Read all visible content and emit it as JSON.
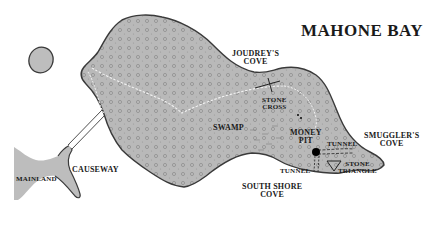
{
  "map": {
    "title": "MAHONE BAY",
    "colors": {
      "land": "#b9b9b9",
      "outline": "#3a3a3a",
      "water": "#ffffff",
      "text": "#1a1a1a",
      "money_pit": "#000000"
    },
    "labels": {
      "joudreys_cove_1": "JOUDREY'S",
      "joudreys_cove_2": "COVE",
      "stone_cross_1": "STONE",
      "stone_cross_2": "CROSS",
      "swamp": "SWAMP",
      "money_pit_1": "MONEY",
      "money_pit_2": "PIT",
      "tunnel_east": "TUNNEL",
      "tunnel_south": "TUNNEL",
      "smugglers_cove_1": "SMUGGLER'S",
      "smugglers_cove_2": "COVE",
      "stone_triangle_1": "STONE",
      "stone_triangle_2": "TRIANGLE",
      "south_shore_cove_1": "SOUTH SHORE",
      "south_shore_cove_2": "COVE",
      "causeway": "CAUSEWAY",
      "mainland": "MAINLAND"
    },
    "markers": [
      {
        "name": "stone-cross",
        "symbol": "cross"
      },
      {
        "name": "money-pit",
        "symbol": "filled-circle"
      },
      {
        "name": "stone-triangle",
        "symbol": "triangle"
      }
    ]
  }
}
